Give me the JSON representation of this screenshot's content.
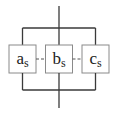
{
  "diagram": {
    "type": "parallel-system",
    "colors": {
      "line": "#3a3a3a",
      "box_border": "#8a8a8a",
      "dash": "#555555"
    },
    "components": [
      {
        "id": "a",
        "base": "a",
        "sub": "s"
      },
      {
        "id": "b",
        "base": "b",
        "sub": "s"
      },
      {
        "id": "c",
        "base": "c",
        "sub": "s"
      }
    ],
    "connections": "parallel branches between top and bottom rails; components joined by dashed links"
  }
}
